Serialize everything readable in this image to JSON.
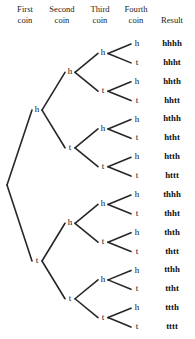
{
  "diagram": {
    "background_color": "#ffffff",
    "line_color": "#272727",
    "text_color": "#141414"
  },
  "headers": [
    {
      "id": "first-coin",
      "line1": "First",
      "line2": "coin",
      "x": 25,
      "two_line": true
    },
    {
      "id": "second-coin",
      "line1": "Second",
      "line2": "coin",
      "x": 62,
      "two_line": true
    },
    {
      "id": "third-coin",
      "line1": "Third",
      "line2": "coin",
      "x": 100,
      "two_line": true
    },
    {
      "id": "fourth-coin",
      "line1": "Fourth",
      "line2": "coin",
      "x": 136,
      "two_line": true
    },
    {
      "id": "result",
      "line1": "",
      "line2": "Result",
      "x": 172,
      "two_line": true
    }
  ],
  "layout": {
    "root": {
      "x": 7,
      "y": 185
    },
    "columns": {
      "level1": 37,
      "level2": 70,
      "level3": 103,
      "level4": 137,
      "result": 172
    },
    "leaf_top": 44,
    "leaf_spacing": 18.87
  },
  "chart_data": {
    "type": "tree",
    "levels": [
      "First coin",
      "Second coin",
      "Third coin",
      "Fourth coin",
      "Result"
    ],
    "branch_labels": [
      "h",
      "t"
    ],
    "nodes_level1": [
      "h",
      "t"
    ],
    "nodes_level2": [
      "h",
      "t",
      "h",
      "t"
    ],
    "nodes_level3": [
      "h",
      "t",
      "h",
      "t",
      "h",
      "t",
      "h",
      "t"
    ],
    "nodes_level4": [
      "h",
      "t",
      "h",
      "t",
      "h",
      "t",
      "h",
      "t",
      "h",
      "t",
      "h",
      "t",
      "h",
      "t",
      "h",
      "t"
    ],
    "results": [
      "hhhh",
      "hhht",
      "hhth",
      "hhtt",
      "hthh",
      "htht",
      "htth",
      "httt",
      "thhh",
      "thht",
      "thth",
      "thtt",
      "tthh",
      "ttht",
      "ttth",
      "tttt"
    ],
    "total_outcomes": 16
  }
}
